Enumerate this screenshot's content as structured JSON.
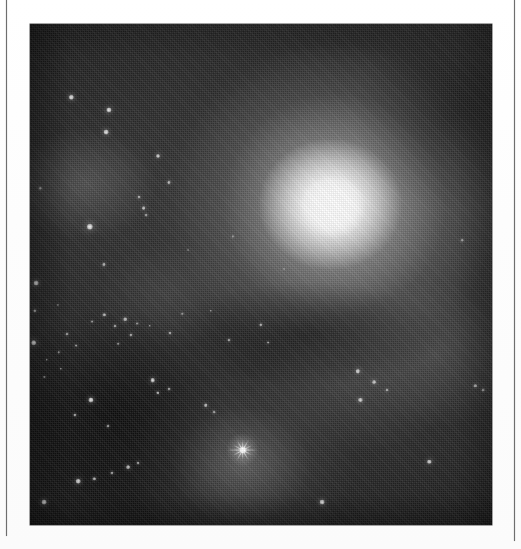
{
  "page": {
    "background_color": "#ffffff",
    "media_type": "scanned-halftone-astronomical-plate",
    "caption": ""
  },
  "rules": {
    "left": {
      "x": 6,
      "y": 0,
      "width": 1.4,
      "height": 536,
      "color": "#6e6e6e"
    },
    "right": {
      "x": 514,
      "y": 0,
      "width": 1.4,
      "height": 541,
      "color": "#6e6e6e"
    }
  },
  "plate": {
    "x": 30,
    "y": 24,
    "width": 462,
    "height": 501,
    "background_color": "#141414",
    "border_color": "#4a4a4a"
  },
  "chart_data": {
    "type": "heatmap",
    "title": "",
    "subtitle": "",
    "xlabel": "",
    "ylabel": "",
    "colormap": "grayscale",
    "value_range": [
      0,
      255
    ],
    "grid": false,
    "legend_position": "none",
    "annotations": [],
    "features": [
      {
        "name": "galaxy-core",
        "cx_pct": 65.5,
        "cy_pct": 36.5,
        "rx_pct": 9,
        "ry_pct": 8,
        "peak_brightness": 252
      },
      {
        "name": "galaxy-halo",
        "cx_pct": 66,
        "cy_pct": 36,
        "rx_pct": 44,
        "ry_pct": 40,
        "peak_brightness": 200
      },
      {
        "name": "nebulosity-lower-center",
        "cx_pct": 46,
        "cy_pct": 88,
        "rx_pct": 34,
        "ry_pct": 26,
        "peak_brightness": 150
      },
      {
        "name": "nebulosity-left",
        "cx_pct": 12,
        "cy_pct": 32,
        "rx_pct": 22,
        "ry_pct": 16,
        "peak_brightness": 110
      },
      {
        "name": "nebulosity-right",
        "cx_pct": 88,
        "cy_pct": 66,
        "rx_pct": 26,
        "ry_pct": 20,
        "peak_brightness": 96
      },
      {
        "name": "dark-sky-background",
        "cx_pct": 14,
        "cy_pct": 80,
        "rx_pct": 30,
        "ry_pct": 28,
        "peak_brightness": 18
      }
    ],
    "stars": [
      {
        "x_pct": 8.9,
        "y_pct": 14.6,
        "r": 2.2,
        "mag": 0.92
      },
      {
        "x_pct": 17.0,
        "y_pct": 17.1,
        "r": 2.6,
        "mag": 0.95
      },
      {
        "x_pct": 16.5,
        "y_pct": 21.6,
        "r": 2.4,
        "mag": 0.92
      },
      {
        "x_pct": 27.7,
        "y_pct": 26.4,
        "r": 2.0,
        "mag": 0.85
      },
      {
        "x_pct": 30.1,
        "y_pct": 31.6,
        "r": 1.6,
        "mag": 0.72
      },
      {
        "x_pct": 23.6,
        "y_pct": 34.5,
        "r": 1.5,
        "mag": 0.68
      },
      {
        "x_pct": 24.6,
        "y_pct": 36.8,
        "r": 1.9,
        "mag": 0.8
      },
      {
        "x_pct": 25.1,
        "y_pct": 38.2,
        "r": 1.4,
        "mag": 0.62
      },
      {
        "x_pct": 12.9,
        "y_pct": 40.5,
        "r": 3.2,
        "mag": 1.0
      },
      {
        "x_pct": 16.0,
        "y_pct": 48.0,
        "r": 1.6,
        "mag": 0.7
      },
      {
        "x_pct": 1.4,
        "y_pct": 51.7,
        "r": 2.4,
        "mag": 0.9
      },
      {
        "x_pct": 1.0,
        "y_pct": 57.2,
        "r": 1.7,
        "mag": 0.7
      },
      {
        "x_pct": 0.8,
        "y_pct": 63.6,
        "r": 2.8,
        "mag": 0.95
      },
      {
        "x_pct": 3.6,
        "y_pct": 67.0,
        "r": 1.3,
        "mag": 0.58
      },
      {
        "x_pct": 6.7,
        "y_pct": 68.8,
        "r": 1.2,
        "mag": 0.55
      },
      {
        "x_pct": 3.1,
        "y_pct": 70.5,
        "r": 1.1,
        "mag": 0.5
      },
      {
        "x_pct": 13.5,
        "y_pct": 59.4,
        "r": 1.4,
        "mag": 0.62
      },
      {
        "x_pct": 16.1,
        "y_pct": 58.1,
        "r": 1.7,
        "mag": 0.72
      },
      {
        "x_pct": 18.4,
        "y_pct": 60.2,
        "r": 1.5,
        "mag": 0.66
      },
      {
        "x_pct": 20.6,
        "y_pct": 58.9,
        "r": 1.8,
        "mag": 0.76
      },
      {
        "x_pct": 21.8,
        "y_pct": 62.1,
        "r": 1.6,
        "mag": 0.7
      },
      {
        "x_pct": 23.2,
        "y_pct": 59.8,
        "r": 1.4,
        "mag": 0.62
      },
      {
        "x_pct": 19.1,
        "y_pct": 63.8,
        "r": 1.3,
        "mag": 0.58
      },
      {
        "x_pct": 8.0,
        "y_pct": 61.9,
        "r": 1.5,
        "mag": 0.66
      },
      {
        "x_pct": 10.0,
        "y_pct": 64.2,
        "r": 1.4,
        "mag": 0.62
      },
      {
        "x_pct": 6.2,
        "y_pct": 65.5,
        "r": 1.2,
        "mag": 0.54
      },
      {
        "x_pct": 25.9,
        "y_pct": 60.2,
        "r": 1.3,
        "mag": 0.58
      },
      {
        "x_pct": 30.4,
        "y_pct": 61.6,
        "r": 1.5,
        "mag": 0.66
      },
      {
        "x_pct": 33.0,
        "y_pct": 57.9,
        "r": 1.2,
        "mag": 0.54
      },
      {
        "x_pct": 43.0,
        "y_pct": 63.1,
        "r": 1.5,
        "mag": 0.66
      },
      {
        "x_pct": 49.9,
        "y_pct": 60.1,
        "r": 1.7,
        "mag": 0.72
      },
      {
        "x_pct": 51.5,
        "y_pct": 63.6,
        "r": 1.4,
        "mag": 0.62
      },
      {
        "x_pct": 39.1,
        "y_pct": 57.3,
        "r": 1.2,
        "mag": 0.52
      },
      {
        "x_pct": 26.6,
        "y_pct": 71.1,
        "r": 2.3,
        "mag": 0.9
      },
      {
        "x_pct": 27.6,
        "y_pct": 73.6,
        "r": 1.7,
        "mag": 0.74
      },
      {
        "x_pct": 30.1,
        "y_pct": 72.8,
        "r": 1.5,
        "mag": 0.66
      },
      {
        "x_pct": 13.1,
        "y_pct": 75.1,
        "r": 2.6,
        "mag": 0.94
      },
      {
        "x_pct": 9.7,
        "y_pct": 78.1,
        "r": 1.6,
        "mag": 0.7
      },
      {
        "x_pct": 16.9,
        "y_pct": 80.2,
        "r": 1.5,
        "mag": 0.66
      },
      {
        "x_pct": 38.0,
        "y_pct": 76.1,
        "r": 1.8,
        "mag": 0.78
      },
      {
        "x_pct": 39.8,
        "y_pct": 77.4,
        "r": 1.4,
        "mag": 0.6
      },
      {
        "x_pct": 71.0,
        "y_pct": 69.3,
        "r": 2.2,
        "mag": 0.86
      },
      {
        "x_pct": 74.5,
        "y_pct": 71.5,
        "r": 1.9,
        "mag": 0.78
      },
      {
        "x_pct": 77.2,
        "y_pct": 73.0,
        "r": 1.5,
        "mag": 0.66
      },
      {
        "x_pct": 71.5,
        "y_pct": 75.1,
        "r": 2.1,
        "mag": 0.84
      },
      {
        "x_pct": 96.4,
        "y_pct": 72.2,
        "r": 1.7,
        "mag": 0.72
      },
      {
        "x_pct": 98.0,
        "y_pct": 73.1,
        "r": 1.4,
        "mag": 0.6
      },
      {
        "x_pct": 93.6,
        "y_pct": 43.1,
        "r": 1.3,
        "mag": 0.56
      },
      {
        "x_pct": 86.4,
        "y_pct": 87.4,
        "r": 2.2,
        "mag": 0.86
      },
      {
        "x_pct": 63.3,
        "y_pct": 95.5,
        "r": 2.4,
        "mag": 0.9
      },
      {
        "x_pct": 17.8,
        "y_pct": 89.6,
        "r": 1.6,
        "mag": 0.68
      },
      {
        "x_pct": 21.2,
        "y_pct": 88.4,
        "r": 1.9,
        "mag": 0.78
      },
      {
        "x_pct": 23.4,
        "y_pct": 87.6,
        "r": 1.5,
        "mag": 0.64
      },
      {
        "x_pct": 10.4,
        "y_pct": 91.3,
        "r": 2.3,
        "mag": 0.88
      },
      {
        "x_pct": 13.9,
        "y_pct": 90.8,
        "r": 1.7,
        "mag": 0.72
      },
      {
        "x_pct": 3.0,
        "y_pct": 95.4,
        "r": 2.4,
        "mag": 0.9
      },
      {
        "x_pct": 6.0,
        "y_pct": 56.0,
        "r": 1.1,
        "mag": 0.48
      },
      {
        "x_pct": 43.9,
        "y_pct": 42.4,
        "r": 1.1,
        "mag": 0.46
      },
      {
        "x_pct": 55.0,
        "y_pct": 49.0,
        "r": 1.0,
        "mag": 0.42
      },
      {
        "x_pct": 34.2,
        "y_pct": 45.1,
        "r": 1.0,
        "mag": 0.42
      },
      {
        "x_pct": 61.2,
        "y_pct": 31.0,
        "r": 1.0,
        "mag": 0.4
      },
      {
        "x_pct": 2.2,
        "y_pct": 32.8,
        "r": 1.2,
        "mag": 0.52
      }
    ],
    "spike_star": {
      "name": "bright-foreground-star",
      "x_pct": 46.1,
      "y_pct": 85.0,
      "spike_count": 6,
      "peak_brightness": 255
    }
  }
}
